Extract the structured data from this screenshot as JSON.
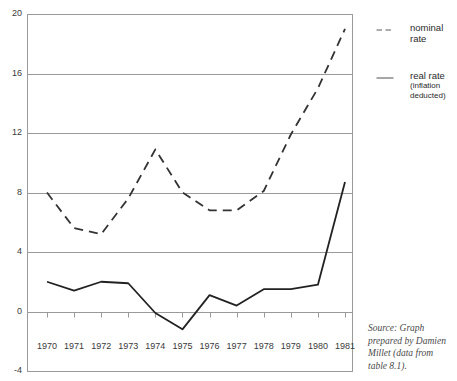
{
  "chart_data": {
    "type": "line",
    "title": "",
    "xlabel": "",
    "ylabel": "",
    "grid": true,
    "legend_position": "right",
    "categories": [
      "1970",
      "1971",
      "1972",
      "1973",
      "1974",
      "1975",
      "1976",
      "1977",
      "1978",
      "1979",
      "1980",
      "1981"
    ],
    "x": [
      1970,
      1971,
      1972,
      1973,
      1974,
      1975,
      1976,
      1977,
      1978,
      1979,
      1980,
      1981
    ],
    "xlim": [
      1970,
      1981
    ],
    "ylim": [
      -4,
      20
    ],
    "ytick_labels": [
      "20",
      "16",
      "12",
      "8",
      "4",
      "0",
      "-4"
    ],
    "yticks": [
      20,
      16,
      12,
      8,
      4,
      0,
      -4
    ],
    "series": [
      {
        "name": "nominal rate",
        "style": "dashed",
        "color": "#333333",
        "values": [
          8.0,
          5.6,
          5.2,
          7.6,
          10.9,
          8.0,
          6.8,
          6.8,
          8.1,
          11.9,
          15.0,
          19.0
        ]
      },
      {
        "name": "real rate (inflation deducted)",
        "style": "solid",
        "color": "#222222",
        "values": [
          2.0,
          1.4,
          2.0,
          1.9,
          -0.1,
          -1.2,
          1.1,
          0.4,
          1.5,
          1.5,
          1.8,
          8.7
        ]
      }
    ]
  },
  "legend": {
    "items": [
      {
        "label": "nominal",
        "label2": "rate",
        "sub": "",
        "sub2": "",
        "style": "dashed"
      },
      {
        "label": "real rate",
        "label2": "",
        "sub": "(inflation",
        "sub2": "deducted)",
        "style": "solid"
      }
    ]
  },
  "source": {
    "line1": "Source: Graph",
    "line2": "prepared by Damien",
    "line3": "Millet (data from",
    "line4": "table 8.1)."
  }
}
